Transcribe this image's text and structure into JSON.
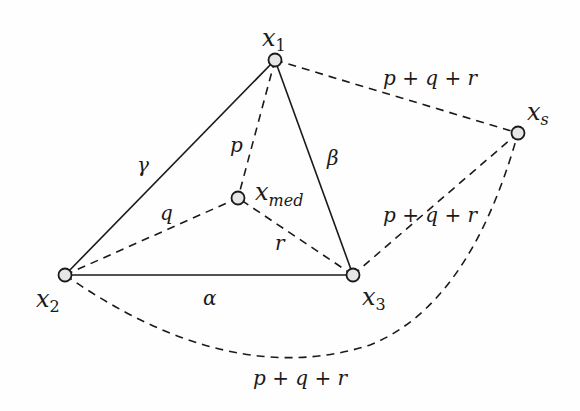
{
  "diagram": {
    "nodes": {
      "x1": {
        "label": "x",
        "sub": "1",
        "cx": 275,
        "cy": 60
      },
      "x2": {
        "label": "x",
        "sub": "2",
        "cx": 65,
        "cy": 275
      },
      "x3": {
        "label": "x",
        "sub": "3",
        "cx": 353,
        "cy": 275
      },
      "xmed": {
        "label": "x",
        "sub": "med",
        "cx": 238,
        "cy": 198
      },
      "xs": {
        "label": "x",
        "sub": "s",
        "cx": 518,
        "cy": 133
      }
    },
    "edge_labels": {
      "gamma": "γ",
      "beta": "β",
      "alpha": "α",
      "p": "p",
      "q": "q",
      "r": "r",
      "x1_xs": "p + q + r",
      "x3_xs": "p + q + r",
      "x2_xs": "p + q + r"
    },
    "colors": {
      "stroke": "#1a1a1a",
      "node_fill": "#e6e6e6"
    }
  }
}
